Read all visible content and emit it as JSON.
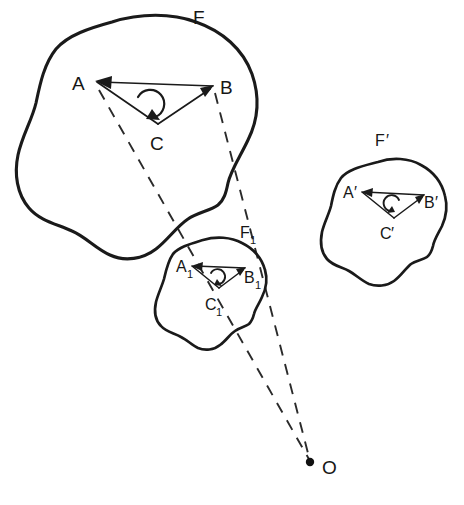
{
  "diagram": {
    "ink_color": "#1a1a1a",
    "background_color": "#ffffff",
    "figures": [
      {
        "id": "F",
        "label": "F",
        "label_x": 193,
        "label_y": 24,
        "role": "original-figure",
        "orientation": "clockwise",
        "triangle": {
          "vertices": [
            {
              "name": "A",
              "label": "A",
              "x": 97,
              "y": 82,
              "label_x": 72,
              "label_y": 90
            },
            {
              "name": "B",
              "label": "B",
              "x": 213,
              "y": 86,
              "label_x": 220,
              "label_y": 94
            },
            {
              "name": "C",
              "label": "C",
              "x": 158,
              "y": 124,
              "label_x": 150,
              "label_y": 150
            }
          ]
        }
      },
      {
        "id": "F1",
        "label": "F",
        "label_subscript": "1",
        "label_x": 240,
        "label_y": 238,
        "role": "homothetic-image",
        "orientation": "clockwise",
        "triangle": {
          "vertices": [
            {
              "name": "A1",
              "label": "A",
              "subscript": "1",
              "x": 192,
              "y": 266,
              "label_x": 180,
              "label_y": 272
            },
            {
              "name": "B1",
              "label": "B",
              "subscript": "1",
              "x": 245,
              "y": 268,
              "label_x": 244,
              "label_y": 281
            },
            {
              "name": "C1",
              "label": "C",
              "subscript": "1",
              "x": 219,
              "y": 288,
              "label_x": 208,
              "label_y": 308
            }
          ]
        }
      },
      {
        "id": "Fprime",
        "label": "F",
        "label_prime": "′",
        "label_x": 379,
        "label_y": 146,
        "role": "congruent-mirrored-figure",
        "orientation": "counter-clockwise",
        "triangle": {
          "vertices": [
            {
              "name": "Aprime",
              "label": "A",
              "prime": "′",
              "x": 362,
              "y": 192,
              "label_x": 347,
              "label_y": 198
            },
            {
              "name": "Bprime",
              "label": "B",
              "prime": "′",
              "x": 424,
              "y": 195,
              "label_x": 424,
              "label_y": 206
            },
            {
              "name": "Cprime",
              "label": "C",
              "prime": "′",
              "x": 394,
              "y": 218,
              "label_x": 383,
              "label_y": 237
            }
          ]
        }
      }
    ],
    "center": {
      "id": "O",
      "label": "O",
      "x": 310,
      "y": 462,
      "label_x": 322,
      "label_y": 474,
      "role": "center-of-similarity"
    },
    "projection_rays": [
      {
        "id": "ray-A",
        "from": "A",
        "through": "A1",
        "to": "O",
        "style": "dashed"
      },
      {
        "id": "ray-B",
        "from": "B",
        "through": "B1",
        "to": "O",
        "style": "dashed"
      }
    ]
  }
}
